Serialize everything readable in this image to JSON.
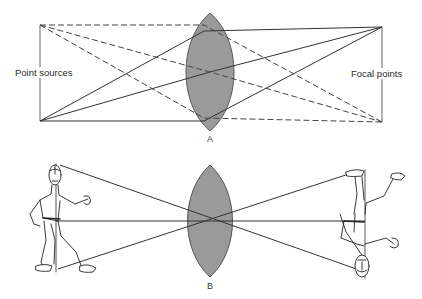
{
  "figure": {
    "panel_a": {
      "label": "A",
      "left_label": "Point sources",
      "right_label": "Focal points",
      "description": "Convex lens focusing two point sources onto two focal points; solid rays from lower source converge at upper focal point, dashed rays from upper source converge at lower focal point"
    },
    "panel_b": {
      "label": "B",
      "description": "Convex lens forming an inverted real image of a walking person"
    },
    "colors": {
      "lens_fill": "#9a9a9a",
      "lens_stroke": "#555555",
      "ray": "#3a3a3a",
      "background": "#ffffff"
    }
  }
}
